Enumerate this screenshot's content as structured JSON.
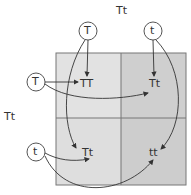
{
  "diagram": {
    "type": "punnett-square",
    "top_parent": {
      "genotype": "Tt",
      "alleles": [
        "T",
        "t"
      ]
    },
    "left_parent": {
      "genotype": "Tt",
      "alleles": [
        "T",
        "t"
      ]
    },
    "cells": [
      {
        "row": 0,
        "col": 0,
        "genotype": "TT"
      },
      {
        "row": 0,
        "col": 1,
        "genotype": "Tt"
      },
      {
        "row": 1,
        "col": 0,
        "genotype": "Tt"
      },
      {
        "row": 1,
        "col": 1,
        "genotype": "tt"
      }
    ],
    "colors": {
      "left_column": "#e0e0e0",
      "right_column": "#cfcfcf",
      "grid_line": "#777777",
      "arrow": "#333333",
      "circle_stroke": "#555555"
    }
  }
}
